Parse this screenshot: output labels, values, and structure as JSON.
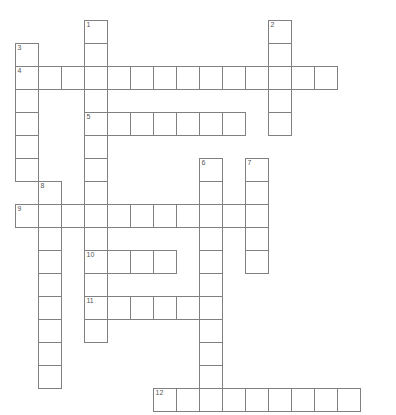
{
  "puzzle": {
    "title": "Crossword Puzzle Grid",
    "type": "crossword-grid",
    "geometry": {
      "image_width": 396,
      "image_height": 415,
      "cell_size": 23,
      "origin_x": 15,
      "origin_y": 20,
      "border_color": "#808080",
      "cell_fill": "#ffffff",
      "background": "#ffffff",
      "number_color": "#555555"
    },
    "entries": [
      {
        "number": "1",
        "direction": "down",
        "col": 3,
        "row": 0,
        "length": 14
      },
      {
        "number": "2",
        "direction": "down",
        "col": 11,
        "row": 0,
        "length": 5
      },
      {
        "number": "3",
        "direction": "down",
        "col": 0,
        "row": 1,
        "length": 6
      },
      {
        "number": "4",
        "direction": "across",
        "col": 0,
        "row": 2,
        "length": 14
      },
      {
        "number": "5",
        "direction": "across",
        "col": 3,
        "row": 4,
        "length": 7
      },
      {
        "number": "6",
        "direction": "down",
        "col": 8,
        "row": 6,
        "length": 10
      },
      {
        "number": "7",
        "direction": "down",
        "col": 10,
        "row": 6,
        "length": 5
      },
      {
        "number": "8",
        "direction": "down",
        "col": 1,
        "row": 7,
        "length": 9
      },
      {
        "number": "9",
        "direction": "across",
        "col": 0,
        "row": 8,
        "length": 11
      },
      {
        "number": "10",
        "direction": "across",
        "col": 3,
        "row": 10,
        "length": 4
      },
      {
        "number": "11",
        "direction": "across",
        "col": 3,
        "row": 12,
        "length": 6
      },
      {
        "number": "12",
        "direction": "across",
        "col": 6,
        "row": 16,
        "length": 9
      }
    ],
    "numbered_cells": [
      {
        "label": "1",
        "col": 3,
        "row": 0
      },
      {
        "label": "2",
        "col": 11,
        "row": 0
      },
      {
        "label": "3",
        "col": 0,
        "row": 1
      },
      {
        "label": "4",
        "col": 0,
        "row": 2
      },
      {
        "label": "5",
        "col": 3,
        "row": 4
      },
      {
        "label": "6",
        "col": 8,
        "row": 6
      },
      {
        "label": "7",
        "col": 10,
        "row": 6
      },
      {
        "label": "8",
        "col": 1,
        "row": 7
      },
      {
        "label": "9",
        "col": 0,
        "row": 8
      },
      {
        "label": "10",
        "col": 3,
        "row": 10
      },
      {
        "label": "11",
        "col": 3,
        "row": 12
      },
      {
        "label": "12",
        "col": 6,
        "row": 16
      }
    ]
  }
}
